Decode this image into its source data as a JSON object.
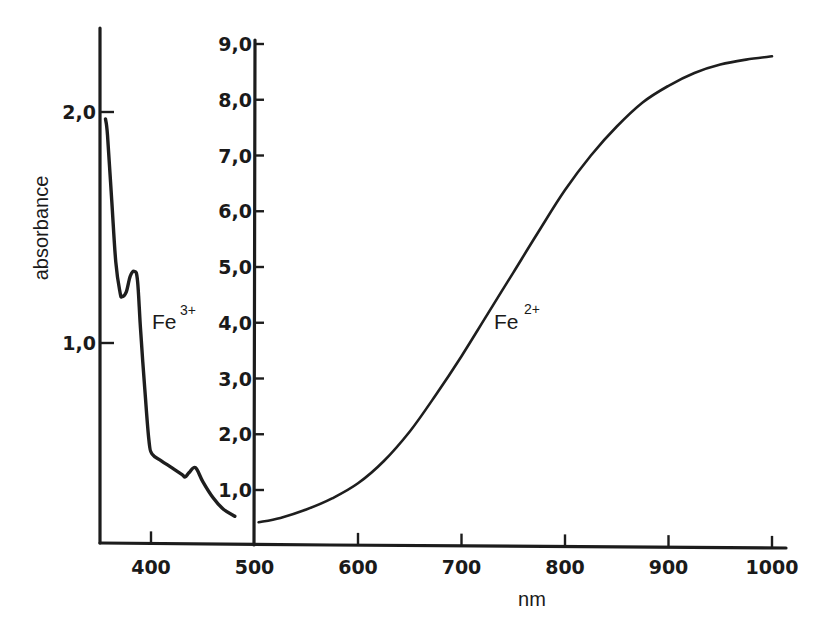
{
  "chart_data": {
    "type": "line",
    "title": "",
    "xlabel": "nm",
    "ylabel": "absorbance",
    "grid": false,
    "legend": "inline labels",
    "x_axis": {
      "ticks": [
        400,
        500,
        600,
        700,
        800,
        900,
        1000
      ],
      "tick_labels": [
        "400",
        "500",
        "600",
        "700",
        "800",
        "900",
        "1000"
      ],
      "range": [
        350,
        1015
      ]
    },
    "y_axes": [
      {
        "name": "left",
        "applies_to": "Fe3+",
        "ticks": [
          1.0,
          2.0
        ],
        "tick_labels": [
          "1,0",
          "2,0"
        ],
        "range": [
          0.13,
          2.35
        ]
      },
      {
        "name": "right",
        "applies_to": "Fe2+",
        "ticks": [
          1.0,
          2.0,
          3.0,
          4.0,
          5.0,
          6.0,
          7.0,
          8.0,
          9.0
        ],
        "tick_labels": [
          "1,0",
          "2,0",
          "3,0",
          "4,0",
          "5,0",
          "6,0",
          "7,0",
          "8,0",
          "9,0"
        ],
        "range": [
          0,
          9.0
        ]
      }
    ],
    "series": [
      {
        "name": "Fe3+",
        "label_base": "Fe",
        "label_sup": "3+",
        "axis": "left",
        "x": [
          356,
          358,
          362,
          366,
          370,
          372,
          376,
          380,
          384,
          387,
          390,
          394,
          398,
          401,
          410,
          420,
          430,
          433,
          437,
          443,
          450,
          460,
          470,
          481
        ],
        "values": [
          1.97,
          1.9,
          1.62,
          1.35,
          1.22,
          1.2,
          1.22,
          1.29,
          1.31,
          1.27,
          1.05,
          0.8,
          0.58,
          0.52,
          0.49,
          0.46,
          0.43,
          0.42,
          0.44,
          0.46,
          0.4,
          0.33,
          0.28,
          0.25
        ]
      },
      {
        "name": "Fe2+",
        "label_base": "Fe",
        "label_sup": "2+",
        "axis": "right",
        "x": [
          504,
          525,
          550,
          575,
          600,
          625,
          650,
          675,
          700,
          725,
          750,
          775,
          800,
          825,
          850,
          875,
          900,
          925,
          950,
          975,
          1000
        ],
        "values": [
          0.42,
          0.5,
          0.65,
          0.85,
          1.12,
          1.52,
          2.05,
          2.7,
          3.4,
          4.15,
          4.9,
          5.65,
          6.38,
          7.0,
          7.52,
          7.95,
          8.25,
          8.48,
          8.63,
          8.72,
          8.78
        ]
      }
    ]
  },
  "labels": {
    "ylabel": "absorbance",
    "xlabel": "nm",
    "fe3_base": "Fe",
    "fe3_sup": "3+",
    "fe2_base": "Fe",
    "fe2_sup": "2+"
  },
  "style": {
    "ink": "#1c1c1c",
    "background": "#ffffff"
  }
}
